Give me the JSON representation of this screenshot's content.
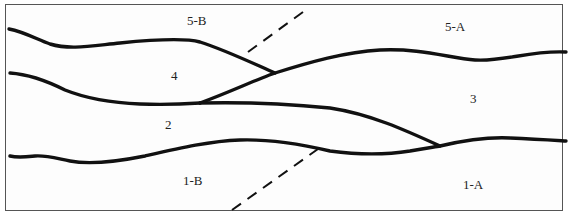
{
  "diagram": {
    "type": "geologic-cross-section-fault-offset",
    "labels": {
      "unit_5b": "5-B",
      "unit_5a": "5-A",
      "unit_4": "4",
      "unit_3": "3",
      "unit_2": "2",
      "unit_1b": "1-B",
      "unit_1a": "1-A"
    },
    "colors": {
      "line": "#111111",
      "border": "#555555",
      "background": "#ffffff",
      "text": "#222222"
    }
  }
}
